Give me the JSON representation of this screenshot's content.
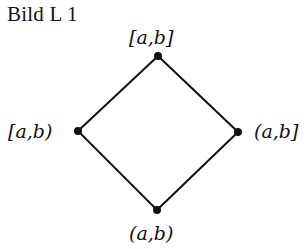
{
  "figure": {
    "caption": "Bild L 1",
    "type": "Hasse diagram (lattice of interval types)",
    "nodes": [
      {
        "id": "top",
        "label": "[a,b]",
        "x": 158,
        "y": 56
      },
      {
        "id": "left",
        "label": "[a,b)",
        "x": 78,
        "y": 131
      },
      {
        "id": "right",
        "label": "(a,b]",
        "x": 238,
        "y": 132
      },
      {
        "id": "bottom",
        "label": "(a,b)",
        "x": 157,
        "y": 210
      }
    ],
    "edges": [
      {
        "from": "top",
        "to": "left"
      },
      {
        "from": "top",
        "to": "right"
      },
      {
        "from": "left",
        "to": "bottom"
      },
      {
        "from": "right",
        "to": "bottom"
      }
    ],
    "colors": {
      "line": "#111111",
      "node": "#111111",
      "background": "#ffffff"
    }
  }
}
